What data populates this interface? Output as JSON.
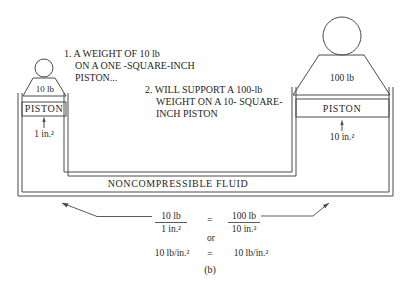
{
  "figure": {
    "label": "(b)",
    "annotation1": {
      "line1": "1. A WEIGHT OF 10 lb",
      "line2": "ON A ONE -SQUARE-INCH",
      "line3": "PISTON..."
    },
    "annotation2": {
      "line1": "2. WILL SUPPORT A 100-lb",
      "line2": "WEIGHT ON A 10- SQUARE-",
      "line3": "INCH PISTON"
    },
    "small_piston": {
      "weight": "10 lb",
      "piston": "PISTON",
      "area": "1 in.²"
    },
    "large_piston": {
      "weight": "100 lb",
      "piston": "PISTON",
      "area": "10 in.²"
    },
    "fluid_label": "NONCOMPRESSIBLE FLUID",
    "equation": {
      "frac1_numerator": "10 lb",
      "frac1_denominator": "1 in.²",
      "equals1": "=",
      "frac2_numerator": "100 lb",
      "frac2_denominator": "10 in.²",
      "or_label": "or",
      "left_pressure": "10 lb/in.²",
      "equals2": "=",
      "right_pressure": "10 lb/in.²"
    },
    "colors": {
      "line": "#4a4a4a",
      "text": "#1f1f1f",
      "background": "#ffffff"
    }
  }
}
